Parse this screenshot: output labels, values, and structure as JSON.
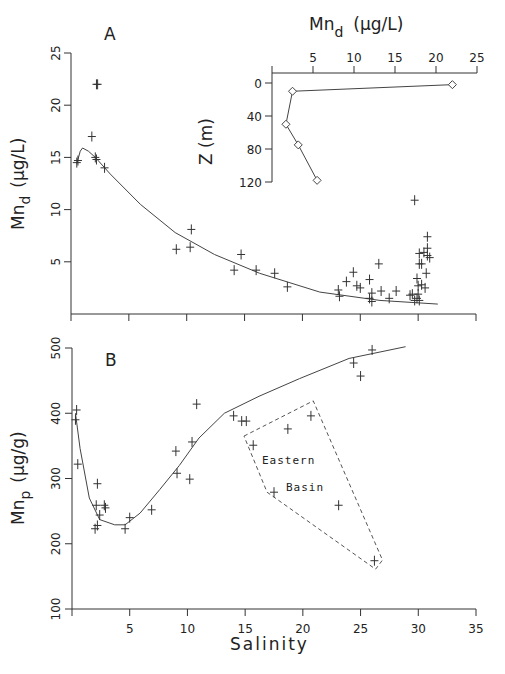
{
  "chart_data": [
    {
      "panel": "A",
      "type": "scatter",
      "title": "A",
      "xlabel": "",
      "ylabel": "Mnd (μg/L)",
      "ylabel_main": "Mn",
      "ylabel_sub": "d",
      "ylabel_unit": "(μg/L)",
      "xlim": [
        0,
        35
      ],
      "ylim": [
        0,
        25
      ],
      "xticks": [
        0,
        5,
        10,
        15,
        20,
        25,
        30,
        35
      ],
      "yticks": [
        5,
        10,
        15,
        20,
        25
      ],
      "ytick_labels": [
        "5",
        "10",
        "15",
        "20",
        "25"
      ],
      "points": [
        [
          2.2,
          22.0
        ],
        [
          2.3,
          22.0
        ],
        [
          1.8,
          17.0
        ],
        [
          0.5,
          14.5
        ],
        [
          0.6,
          14.7
        ],
        [
          2.1,
          15.0
        ],
        [
          2.2,
          14.8
        ],
        [
          2.9,
          14.0
        ],
        [
          9.1,
          6.2
        ],
        [
          10.3,
          6.4
        ],
        [
          10.4,
          8.1
        ],
        [
          14.1,
          4.2
        ],
        [
          14.7,
          5.7
        ],
        [
          16.0,
          4.2
        ],
        [
          17.6,
          3.9
        ],
        [
          18.7,
          2.6
        ],
        [
          23.1,
          2.3
        ],
        [
          23.2,
          1.7
        ],
        [
          23.8,
          3.1
        ],
        [
          24.4,
          4.0
        ],
        [
          24.7,
          2.7
        ],
        [
          25.0,
          2.5
        ],
        [
          25.8,
          3.3
        ],
        [
          26.6,
          4.8
        ],
        [
          26.0,
          2.0
        ],
        [
          25.8,
          1.5
        ],
        [
          26.0,
          1.2
        ],
        [
          26.8,
          2.2
        ],
        [
          27.5,
          1.5
        ],
        [
          28.1,
          2.2
        ],
        [
          29.3,
          1.8
        ],
        [
          29.5,
          1.9
        ],
        [
          30.0,
          1.9
        ],
        [
          29.9,
          1.5
        ],
        [
          29.7,
          1.3
        ],
        [
          30.1,
          1.3
        ],
        [
          29.7,
          10.9
        ],
        [
          30.8,
          7.4
        ],
        [
          30.8,
          6.3
        ],
        [
          30.8,
          5.6
        ],
        [
          30.5,
          5.9
        ],
        [
          30.1,
          5.8
        ],
        [
          31.0,
          5.4
        ],
        [
          30.1,
          4.8
        ],
        [
          30.3,
          4.8
        ],
        [
          30.7,
          3.9
        ],
        [
          29.9,
          3.4
        ],
        [
          30.6,
          2.5
        ],
        [
          30.3,
          2.8
        ],
        [
          30.0,
          2.7
        ]
      ],
      "fit_curve": [
        [
          0.5,
          14.4
        ],
        [
          0.8,
          15.6
        ],
        [
          1.0,
          15.9
        ],
        [
          1.5,
          15.6
        ],
        [
          2.1,
          15.0
        ],
        [
          3.4,
          13.4
        ],
        [
          6.0,
          10.5
        ],
        [
          9.0,
          7.8
        ],
        [
          12.4,
          5.7
        ],
        [
          16.3,
          3.9
        ],
        [
          21.5,
          2.1
        ],
        [
          26.7,
          1.3
        ],
        [
          31.7,
          0.95
        ]
      ],
      "marker": "plus"
    },
    {
      "panel": "A-inset",
      "type": "line",
      "title": "Mnd (μg/L)",
      "xlabel_main": "Mn",
      "xlabel_sub": "d",
      "xlabel_unit": "(μg/L)",
      "ylabel": "Z (m)",
      "xlim": [
        0,
        25
      ],
      "ylim": [
        120,
        0
      ],
      "xticks": [
        5,
        10,
        15,
        20,
        25
      ],
      "xtick_labels": [
        "5",
        "10",
        "15",
        "20",
        "25"
      ],
      "yticks": [
        0,
        40,
        80,
        120
      ],
      "ytick_labels": [
        "0",
        "40",
        "80",
        "120"
      ],
      "points": [
        [
          22.0,
          2
        ],
        [
          2.5,
          10
        ],
        [
          1.7,
          50
        ],
        [
          3.2,
          75
        ],
        [
          5.5,
          118
        ]
      ],
      "marker": "diamond"
    },
    {
      "panel": "B",
      "type": "scatter",
      "title": "B",
      "xlabel": "Salinity",
      "ylabel": "Mnp (μg/g)",
      "ylabel_main": "Mn",
      "ylabel_sub": "p",
      "ylabel_unit": "(μg/g)",
      "xlim": [
        0,
        35
      ],
      "ylim": [
        100,
        500
      ],
      "xticks": [
        0,
        5,
        10,
        15,
        20,
        25,
        30,
        35
      ],
      "xtick_labels": [
        "5",
        "10",
        "15",
        "20",
        "25",
        "30",
        "35"
      ],
      "yticks": [
        100,
        200,
        300,
        400,
        500
      ],
      "ytick_labels": [
        "100",
        "200",
        "300",
        "400",
        "500"
      ],
      "points": [
        [
          0.4,
          405
        ],
        [
          0.3,
          390
        ],
        [
          0.5,
          322
        ],
        [
          2.2,
          292
        ],
        [
          2.1,
          259
        ],
        [
          2.4,
          244
        ],
        [
          2.8,
          259
        ],
        [
          2.9,
          255
        ],
        [
          2.0,
          223
        ],
        [
          2.2,
          228
        ],
        [
          4.6,
          223
        ],
        [
          5.0,
          240
        ],
        [
          6.9,
          252
        ],
        [
          9.0,
          342
        ],
        [
          9.1,
          308
        ],
        [
          10.2,
          299
        ],
        [
          10.4,
          356
        ],
        [
          10.8,
          414
        ],
        [
          14.0,
          396
        ],
        [
          14.7,
          388
        ],
        [
          15.1,
          388
        ],
        [
          24.4,
          477
        ],
        [
          25.0,
          457
        ],
        [
          26.0,
          497
        ]
      ],
      "eastern_basin_points": [
        [
          15.7,
          351
        ],
        [
          18.7,
          376
        ],
        [
          20.7,
          396
        ],
        [
          17.5,
          279
        ],
        [
          23.1,
          259
        ],
        [
          26.2,
          174
        ]
      ],
      "eastern_basin_polygon": [
        [
          14.9,
          365
        ],
        [
          20.9,
          419
        ],
        [
          26.9,
          175
        ],
        [
          26.3,
          161
        ],
        [
          16.9,
          279
        ]
      ],
      "annotations": [
        "Eastern",
        "Basin"
      ],
      "fit_curve": [
        [
          0.3,
          400
        ],
        [
          0.7,
          346
        ],
        [
          1.5,
          270
        ],
        [
          2.4,
          237
        ],
        [
          3.7,
          229
        ],
        [
          4.6,
          229
        ],
        [
          5.9,
          247
        ],
        [
          7.6,
          283
        ],
        [
          9.3,
          320
        ],
        [
          11.0,
          362
        ],
        [
          13.2,
          400
        ],
        [
          16.2,
          426
        ],
        [
          19.7,
          453
        ],
        [
          24.0,
          484
        ],
        [
          28.9,
          502
        ]
      ],
      "marker": "plus"
    }
  ],
  "caption_visible": false
}
